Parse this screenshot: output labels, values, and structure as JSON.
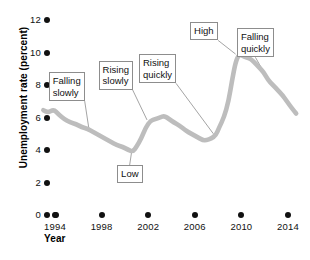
{
  "chart_data": {
    "type": "line",
    "title": "",
    "xlabel": "Year",
    "ylabel": "Unemployment rate (percent)",
    "xlim": [
      1993,
      2015
    ],
    "ylim": [
      0,
      12
    ],
    "grid": false,
    "legend": "none",
    "line_color": "#bdbdbd",
    "y_ticks": [
      0,
      2,
      4,
      6,
      8,
      10,
      12
    ],
    "y_tick_labels": [
      "0",
      "2",
      "4",
      "6",
      "8",
      "10",
      "12"
    ],
    "x_ticks": [
      1994,
      1998,
      2002,
      2006,
      2010,
      2014
    ],
    "x_tick_labels": [
      "1994",
      "1998",
      "2002",
      "2006",
      "2010",
      "2014"
    ],
    "series": [
      {
        "name": "Unemployment rate",
        "x": [
          1993.0,
          1993.4,
          1993.9,
          1994.3,
          1994.8,
          1995.3,
          1995.8,
          1996.3,
          1996.8,
          1997.3,
          1997.8,
          1998.3,
          1998.8,
          1999.3,
          1999.8,
          2000.3,
          2000.7,
          2001.0,
          2001.4,
          2001.8,
          2002.2,
          2002.6,
          2003.0,
          2003.4,
          2003.8,
          2004.2,
          2004.7,
          2005.2,
          2005.7,
          2006.2,
          2006.7,
          2007.0,
          2007.4,
          2007.8,
          2008.1,
          2008.5,
          2008.9,
          2009.2,
          2009.5,
          2009.8,
          2010.1,
          2010.4,
          2010.8,
          2011.1,
          2011.5,
          2011.9,
          2012.3,
          2012.7,
          2013.1,
          2013.5,
          2013.9,
          2014.3,
          2014.7
        ],
        "y": [
          6.45,
          6.3,
          6.5,
          6.2,
          5.9,
          5.7,
          5.6,
          5.4,
          5.3,
          5.1,
          4.9,
          4.7,
          4.5,
          4.3,
          4.2,
          4.0,
          3.9,
          4.2,
          4.7,
          5.4,
          5.8,
          5.9,
          6.0,
          6.1,
          5.9,
          5.7,
          5.5,
          5.2,
          5.0,
          4.8,
          4.6,
          4.6,
          4.7,
          4.9,
          5.4,
          6.0,
          7.0,
          8.3,
          9.4,
          9.9,
          9.8,
          9.7,
          9.6,
          9.4,
          9.1,
          8.8,
          8.3,
          8.0,
          7.7,
          7.4,
          7.0,
          6.6,
          6.25
        ],
        "color": "#bdbdbd"
      }
    ],
    "annotations": [
      {
        "id": "falling-slowly",
        "text": "Falling\nslowly",
        "x": 1995.0,
        "y": 7.9,
        "target_x": 1996.9,
        "target_y": 5.35
      },
      {
        "id": "rising-slowly",
        "text": "Rising\nslowly",
        "x": 1999.2,
        "y": 8.6,
        "target_x": 2001.9,
        "target_y": 5.85
      },
      {
        "id": "low",
        "text": "Low",
        "x": 2000.4,
        "y": 2.5,
        "target_x": 2000.6,
        "target_y": 4.0
      },
      {
        "id": "rising-quickly",
        "text": "Rising\nquickly",
        "x": 2002.8,
        "y": 9.0,
        "target_x": 2007.6,
        "target_y": 5.0
      },
      {
        "id": "high",
        "text": "High",
        "x": 2006.8,
        "y": 11.3,
        "target_x": 2009.5,
        "target_y": 9.9
      },
      {
        "id": "falling-quickly",
        "text": "Falling\nquickly",
        "x": 2011.2,
        "y": 10.6,
        "target_x": 2012.4,
        "target_y": 8.2
      }
    ]
  },
  "axes": {
    "y_title": "Unemployment rate (percent)",
    "x_title": "Year"
  }
}
